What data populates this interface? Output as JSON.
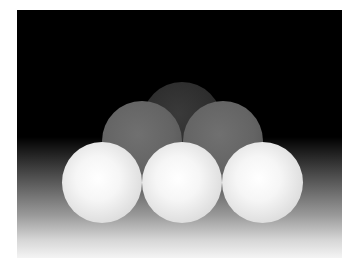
{
  "image": {
    "description": "Rendered grayscale scene of six spheres stacked in a pyramid on a floor gradient",
    "background_color": "#000000",
    "floor_gradient": [
      "#000000",
      "#f4f4f4"
    ],
    "spheres": [
      {
        "id": "back-top",
        "row": "back",
        "cx": 165,
        "cy": 112,
        "r": 40,
        "shade": "#2c2c2c"
      },
      {
        "id": "middle-left",
        "row": "middle",
        "cx": 125,
        "cy": 131,
        "r": 40,
        "shade": "#646464"
      },
      {
        "id": "middle-right",
        "row": "middle",
        "cx": 205,
        "cy": 131,
        "r": 40,
        "shade": "#646464"
      },
      {
        "id": "front-left",
        "row": "front",
        "cx": 85,
        "cy": 172,
        "r": 40,
        "shade": "#f6f6f6"
      },
      {
        "id": "front-center",
        "row": "front",
        "cx": 165,
        "cy": 172,
        "r": 40,
        "shade": "#f6f6f6"
      },
      {
        "id": "front-right",
        "row": "front",
        "cx": 245,
        "cy": 172,
        "r": 40,
        "shade": "#f6f6f6"
      }
    ]
  }
}
